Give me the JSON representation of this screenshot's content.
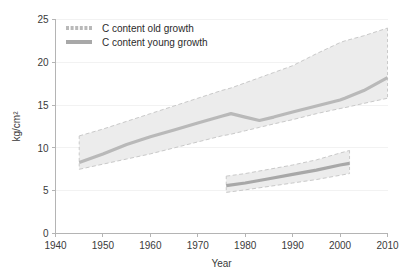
{
  "chart_data": {
    "type": "line",
    "title": "",
    "xlabel": "Year",
    "ylabel": "kg/cm2",
    "ylabel_display": "kg/cm²",
    "xlim": [
      1940,
      2010
    ],
    "ylim": [
      0,
      25
    ],
    "xticks": [
      1940,
      1950,
      1960,
      1970,
      1980,
      1990,
      2000,
      2010
    ],
    "xtick_labels": [
      "1940",
      "1950",
      "1960",
      "1970",
      "1980",
      "1990",
      "2000",
      "2010"
    ],
    "yticks": [
      0,
      5,
      10,
      15,
      20,
      25
    ],
    "ytick_labels": [
      "0",
      "5",
      "10",
      "15",
      "20",
      "25"
    ],
    "grid": false,
    "legend_position": "top-left",
    "band_fill": "#ececec",
    "band_edge": "#c9c9c9",
    "series": [
      {
        "name": "C content old growth",
        "legend_label": "C content old growth",
        "color": "#b9b9b9",
        "swatch_style": "dashed",
        "x": [
          1945,
          1950,
          1955,
          1960,
          1965,
          1970,
          1975,
          1977,
          1980,
          1983,
          1986,
          1990,
          1995,
          2000,
          2001,
          2005,
          2010
        ],
        "values": [
          8.3,
          9.3,
          10.4,
          11.3,
          12.1,
          12.9,
          13.7,
          14.0,
          13.6,
          13.2,
          13.6,
          14.2,
          14.9,
          15.6,
          15.8,
          16.7,
          18.2
        ],
        "band_upper": [
          11.4,
          12.2,
          13.1,
          14.0,
          14.9,
          15.8,
          16.7,
          17.0,
          17.6,
          18.2,
          18.8,
          19.6,
          21.0,
          22.3,
          22.5,
          23.1,
          24.0
        ],
        "band_lower": [
          7.5,
          8.1,
          8.7,
          9.3,
          10.0,
          10.7,
          11.4,
          11.6,
          12.0,
          12.4,
          12.8,
          13.3,
          14.0,
          14.6,
          14.7,
          15.2,
          15.8
        ]
      },
      {
        "name": "C content young growth",
        "legend_label": "C content young growth",
        "color": "#a8a8a8",
        "swatch_style": "solid",
        "x": [
          1976,
          1980,
          1985,
          1990,
          1995,
          2000,
          2002
        ],
        "values": [
          5.6,
          5.9,
          6.4,
          6.9,
          7.4,
          8.0,
          8.2
        ],
        "band_upper": [
          6.7,
          7.0,
          7.5,
          8.0,
          8.6,
          9.4,
          9.7
        ],
        "band_lower": [
          4.8,
          5.1,
          5.5,
          5.9,
          6.3,
          6.8,
          7.0
        ]
      }
    ]
  },
  "axes": {
    "x_axis_name": "year-axis",
    "y_axis_name": "carbon-content-axis"
  }
}
